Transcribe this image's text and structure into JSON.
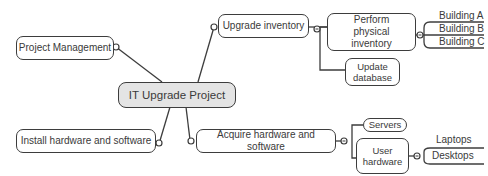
{
  "mindmap": {
    "central": {
      "label": "IT Upgrade Project"
    },
    "project_management": {
      "label": "Project Management"
    },
    "install": {
      "label": "Install hardware and software"
    },
    "upgrade_inventory": {
      "label": "Upgrade inventory"
    },
    "perform_physical": {
      "label": "Perform physical inventory"
    },
    "update_database": {
      "label": "Update database"
    },
    "buildings": [
      {
        "label": "Building A"
      },
      {
        "label": "Building B"
      },
      {
        "label": "Building C"
      }
    ],
    "acquire": {
      "label": "Acquire hardware and software"
    },
    "servers": {
      "label": "Servers"
    },
    "user_hardware": {
      "label": "User hardware"
    },
    "laptops": {
      "label": "Laptops"
    },
    "desktops": {
      "label": "Desktops"
    }
  },
  "colors": {
    "line": "#3d3d3d",
    "central_fill": "#e4e4e4",
    "text": "#3a3a3a"
  }
}
